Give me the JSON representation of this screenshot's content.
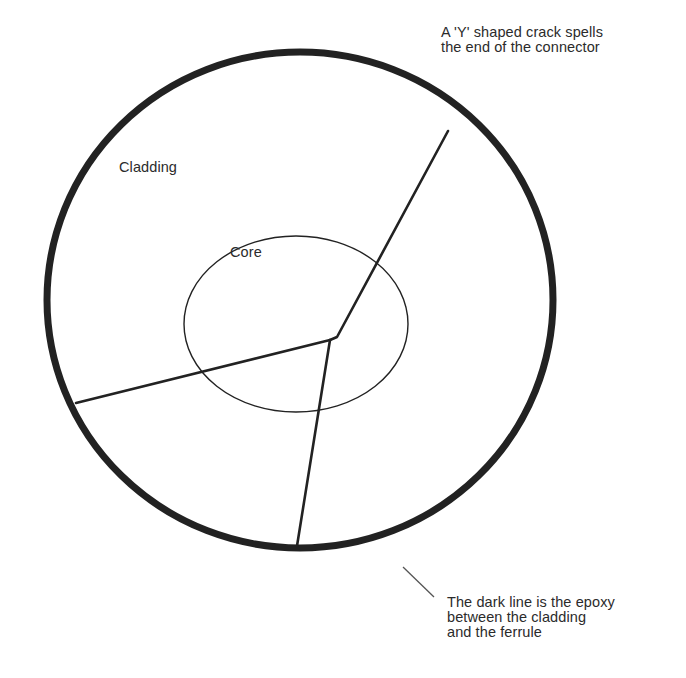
{
  "diagram": {
    "colors": {
      "background": "#ffffff",
      "stroke": "#222222",
      "leader": "#555555",
      "text": "#2b2b2b"
    },
    "outer_ring": {
      "cx": 300,
      "cy": 300,
      "rx": 253,
      "ry": 248,
      "stroke_width": 7
    },
    "core_circle": {
      "cx": 296,
      "cy": 324,
      "rx": 112,
      "ry": 88,
      "stroke_width": 1.4
    },
    "crack": {
      "junction": [
        330,
        340
      ],
      "branches": [
        {
          "name": "upper-right",
          "points": [
            [
              330,
              340
            ],
            [
              337,
              337
            ],
            [
              448,
              131
            ]
          ]
        },
        {
          "name": "left",
          "points": [
            [
              330,
              340
            ],
            [
              76,
              403
            ]
          ]
        },
        {
          "name": "down",
          "points": [
            [
              330,
              340
            ],
            [
              297,
              546
            ]
          ]
        }
      ],
      "stroke_width": 2.6
    },
    "leader_line": {
      "from": [
        403,
        567
      ],
      "to": [
        434,
        597
      ]
    }
  },
  "labels": {
    "crack_note": {
      "line1": "A 'Y' shaped crack spells",
      "line2": "the end of the connector"
    },
    "cladding": "Cladding",
    "core": "Core",
    "epoxy_note": {
      "line1": "The dark line is the epoxy",
      "line2": "between the cladding",
      "line3": "and the ferrule"
    }
  }
}
